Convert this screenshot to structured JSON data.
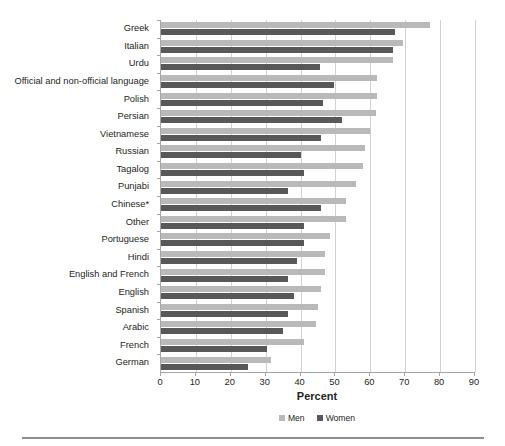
{
  "chart_data": {
    "type": "bar",
    "orientation": "horizontal",
    "title": "",
    "xlabel": "Percent",
    "ylabel": "",
    "xlim": [
      0,
      90
    ],
    "xticks": [
      0,
      10,
      20,
      30,
      40,
      50,
      60,
      70,
      80,
      90
    ],
    "grid": true,
    "legend_position": "bottom",
    "categories": [
      "Greek",
      "Italian",
      "Urdu",
      "Official and non-official language",
      "Polish",
      "Persian",
      "Vietnamese",
      "Russian",
      "Tagalog",
      "Punjabi",
      "Chinese*",
      "Other",
      "Portuguese",
      "Hindi",
      "English and French",
      "English",
      "Spanish",
      "Arabic",
      "French",
      "German"
    ],
    "series": [
      {
        "name": "Men",
        "color": "#b9b9b9",
        "values": [
          77.0,
          69.5,
          66.5,
          62.0,
          62.0,
          61.5,
          60.0,
          58.5,
          58.0,
          56.0,
          53.0,
          53.0,
          48.5,
          47.0,
          47.0,
          46.0,
          45.0,
          44.5,
          41.0,
          31.5
        ]
      },
      {
        "name": "Women",
        "color": "#58585a",
        "values": [
          67.0,
          66.5,
          45.5,
          49.5,
          46.5,
          52.0,
          46.0,
          40.0,
          41.0,
          36.5,
          46.0,
          41.0,
          41.0,
          39.0,
          36.5,
          38.0,
          36.5,
          35.0,
          30.5,
          25.0
        ]
      }
    ]
  },
  "legend": {
    "items": [
      {
        "label": "Men",
        "color": "#b9b9b9"
      },
      {
        "label": "Women",
        "color": "#58585a"
      }
    ]
  },
  "axis": {
    "x_title": "Percent"
  }
}
